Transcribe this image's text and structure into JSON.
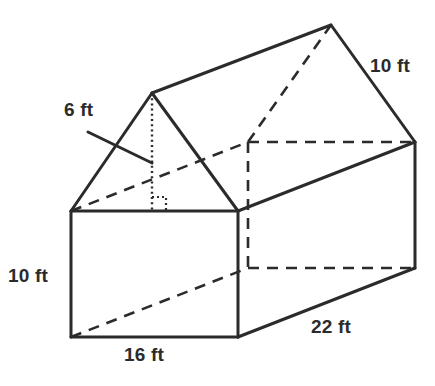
{
  "figure": {
    "kind": "house-shaped-prism-diagram",
    "canvas": {
      "width": 435,
      "height": 386
    },
    "colors": {
      "background": "#ffffff",
      "stroke": "#2b2b2b",
      "hidden_stroke": "#2b2b2b",
      "text": "#2b2b2b"
    },
    "stroke_widths": {
      "visible": 3,
      "hidden": 2.6,
      "height_line": 2.4,
      "right_angle": 2.2,
      "leader": 3
    }
  },
  "labels": {
    "roof_height": {
      "text": "6 ft",
      "x": 64,
      "y": 100
    },
    "roof_slant": {
      "text": "10 ft",
      "x": 370,
      "y": 56
    },
    "wall_height": {
      "text": "10 ft",
      "x": 8,
      "y": 266
    },
    "base_width": {
      "text": "16 ft",
      "x": 124,
      "y": 345
    },
    "base_depth": {
      "text": "22 ft",
      "x": 311,
      "y": 317
    }
  },
  "geometry": {
    "vertices": {
      "front_apex": [
        152,
        93
      ],
      "rear_apex": [
        331,
        25
      ],
      "front_eave_left": [
        71,
        211
      ],
      "front_eave_right": [
        238,
        211
      ],
      "rear_eave_left": [
        248,
        142
      ],
      "rear_eave_right": [
        415,
        142
      ],
      "front_floor_left": [
        71,
        337
      ],
      "front_floor_right": [
        238,
        337
      ],
      "rear_floor_left": [
        248,
        268
      ],
      "rear_floor_right": [
        415,
        268
      ]
    },
    "visible_edges": [
      {
        "name": "front-gable-left-slope",
        "points": "71,211 152,93"
      },
      {
        "name": "front-gable-right-slope",
        "points": "152,93 238,211"
      },
      {
        "name": "front-eave-line",
        "points": "71,211 238,211"
      },
      {
        "name": "roof-ridge",
        "points": "152,93 331,25"
      },
      {
        "name": "rear-gable-right-slope",
        "points": "331,25 415,142"
      },
      {
        "name": "roof-right-slope-edge",
        "points": "238,211 415,142"
      },
      {
        "name": "front-wall-left-edge",
        "points": "71,211 71,337"
      },
      {
        "name": "front-wall-right-edge",
        "points": "238,211 238,337"
      },
      {
        "name": "front-wall-bottom-edge",
        "points": "71,337 238,337"
      },
      {
        "name": "right-wall-bottom-edge",
        "points": "238,337 415,268"
      },
      {
        "name": "right-wall-back-edge",
        "points": "415,142 415,268"
      }
    ],
    "hidden_edges": [
      {
        "name": "hidden-rear-gable-left-slope",
        "points": "248,142 331,25"
      },
      {
        "name": "hidden-rear-eave-line",
        "points": "248,142 415,142"
      },
      {
        "name": "hidden-left-roof-slope-edge",
        "points": "71,211 248,142"
      },
      {
        "name": "hidden-back-left-vertical",
        "points": "248,142 248,268"
      },
      {
        "name": "hidden-floor-diagonal-left",
        "points": "71,337 248,268"
      },
      {
        "name": "hidden-rear-floor-line",
        "points": "248,268 415,268"
      }
    ],
    "height_line": {
      "name": "roof-apex-height",
      "points": "152,93 152,211"
    },
    "right_angle_marker": {
      "points": "152,197 166,197 166,211"
    },
    "leader_line": {
      "name": "six-ft-leader",
      "points": "88,132 152,163"
    }
  }
}
